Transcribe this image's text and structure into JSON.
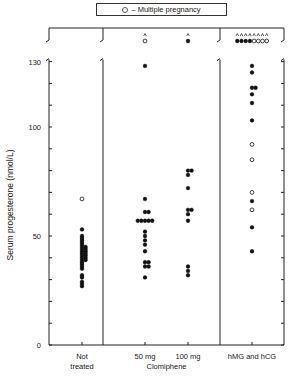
{
  "legend": {
    "symbol": "open-circle",
    "text": "– Multiple pregnancy"
  },
  "chart_data": {
    "type": "scatter",
    "title": "",
    "xlabel": "",
    "ylabel": "Serum progesterone (nmol/L)",
    "ylim": [
      0,
      130
    ],
    "yticks": [
      0,
      10,
      20,
      30,
      40,
      50,
      60,
      70,
      80,
      90,
      100,
      110,
      120,
      130
    ],
    "ytick_labels": [
      {
        "value": 0,
        "label": "0"
      },
      {
        "value": 50,
        "label": "50"
      },
      {
        "value": 100,
        "label": "100"
      },
      {
        "value": 130,
        "label": "130"
      }
    ],
    "grid": false,
    "legend_position": "top-center",
    "categories": [
      {
        "key": "not_treated",
        "label_line1": "Not",
        "label_line2": "treated"
      },
      {
        "key": "clomiphene_50",
        "label_line1": "50 mg",
        "label_line2": ""
      },
      {
        "key": "clomiphene_100",
        "label_line1": "100 mg",
        "label_line2": ""
      },
      {
        "key": "hmg_hcg",
        "label_line1": "hMG and hCG",
        "label_line2": ""
      }
    ],
    "group_label": "Clomiphene",
    "series": [
      {
        "name": "Not treated",
        "filled": [
          53,
          50,
          49,
          48,
          47,
          46,
          45,
          45,
          44,
          44,
          43,
          43,
          42,
          42,
          41,
          41,
          40,
          40,
          39,
          39,
          38,
          37,
          36,
          35,
          32,
          31,
          29,
          28,
          27
        ],
        "open": [
          67
        ],
        "offscale_filled": 0,
        "offscale_open": 0
      },
      {
        "name": "Clomiphene 50 mg",
        "filled": [
          128,
          67,
          61,
          61,
          57,
          57,
          57,
          57,
          57,
          52,
          50,
          48,
          46,
          43,
          38,
          38,
          36,
          36,
          31
        ],
        "open": [],
        "offscale_filled": 0,
        "offscale_open": 1
      },
      {
        "name": "Clomiphene 100 mg",
        "filled": [
          80,
          80,
          78,
          72,
          62,
          62,
          60,
          57,
          36,
          34,
          32
        ],
        "open": [],
        "offscale_filled": 1,
        "offscale_open": 0
      },
      {
        "name": "hMG and hCG",
        "filled": [
          128,
          125,
          118,
          118,
          115,
          111,
          103,
          66,
          54,
          43
        ],
        "open": [
          92,
          85,
          70,
          62
        ],
        "offscale_filled": 4,
        "offscale_open": 4
      }
    ]
  }
}
